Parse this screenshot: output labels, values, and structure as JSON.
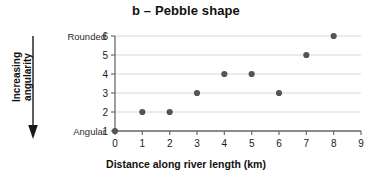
{
  "chart_data": {
    "type": "scatter",
    "title": "b – Pebble shape",
    "xlabel": "Distance along river length (km)",
    "ylabel": "",
    "x": [
      0,
      1,
      2,
      3,
      4,
      5,
      6,
      7,
      8
    ],
    "values": [
      1,
      2,
      2,
      3,
      4,
      4,
      3,
      5,
      6
    ],
    "points": [
      {
        "x": 0,
        "y": 1
      },
      {
        "x": 1,
        "y": 2
      },
      {
        "x": 2,
        "y": 2
      },
      {
        "x": 3,
        "y": 3
      },
      {
        "x": 4,
        "y": 4
      },
      {
        "x": 5,
        "y": 4
      },
      {
        "x": 6,
        "y": 3
      },
      {
        "x": 7,
        "y": 5
      },
      {
        "x": 8,
        "y": 6
      }
    ],
    "xlim": [
      0,
      9
    ],
    "ylim": [
      1,
      6
    ],
    "xticks": [
      "0",
      "1",
      "2",
      "3",
      "4",
      "5",
      "6",
      "7",
      "8",
      "9"
    ],
    "yticks": [
      "1",
      "2",
      "3",
      "4",
      "5",
      "6"
    ],
    "grid": "horizontal",
    "legend": "none",
    "marker_color": "#555555",
    "grid_color": "#d8d8d8",
    "axis_color": "#6b6b6b"
  },
  "annotations": {
    "side_label": "Increasing\nangularity",
    "y_top_caption": "Rounded",
    "y_bottom_caption": "Angular",
    "arrow_direction": "down"
  }
}
